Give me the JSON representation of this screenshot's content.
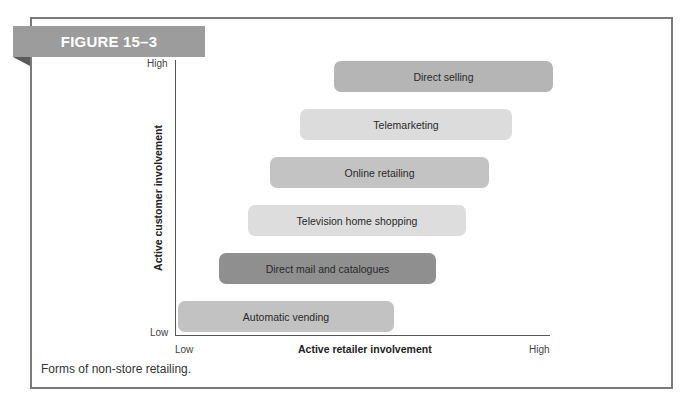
{
  "figure": {
    "label": "FIGURE 15–3",
    "caption": "Forms of non-store retailing."
  },
  "axes": {
    "y_label": "Active customer involvement",
    "x_label": "Active retailer involvement",
    "y_high": "High",
    "y_low": "Low",
    "x_low": "Low",
    "x_high": "High"
  },
  "bars": [
    {
      "label": "Direct selling",
      "left": 334,
      "top": 61,
      "width": 219,
      "color": "#b5b5b5"
    },
    {
      "label": "Telemarketing",
      "left": 300,
      "top": 109,
      "width": 212,
      "color": "#dcdcdc"
    },
    {
      "label": "Online retailing",
      "left": 270,
      "top": 157,
      "width": 219,
      "color": "#c3c3c3"
    },
    {
      "label": "Television home shopping",
      "left": 248,
      "top": 205,
      "width": 218,
      "color": "#dddddd"
    },
    {
      "label": "Direct mail and catalogues",
      "left": 219,
      "top": 253,
      "width": 217,
      "color": "#8f8f8f"
    },
    {
      "label": "Automatic vending",
      "left": 178,
      "top": 301,
      "width": 216,
      "color": "#c2c2c2"
    }
  ],
  "chart_data": {
    "type": "bar",
    "orientation": "horizontal-range",
    "xlabel": "Active retailer involvement",
    "ylabel": "Active customer involvement",
    "x_ticks": [
      "Low",
      "High"
    ],
    "y_ticks": [
      "Low",
      "High"
    ],
    "categories": [
      "Automatic vending",
      "Direct mail and catalogues",
      "Television home shopping",
      "Online retailing",
      "Telemarketing",
      "Direct selling"
    ],
    "ranges_x_normalized": [
      [
        0.01,
        0.58
      ],
      [
        0.12,
        0.7
      ],
      [
        0.2,
        0.78
      ],
      [
        0.25,
        0.84
      ],
      [
        0.33,
        0.9
      ],
      [
        0.42,
        1.0
      ]
    ],
    "y_rank_low_to_high": [
      1,
      2,
      3,
      4,
      5,
      6
    ],
    "grid": false,
    "legend": null
  }
}
